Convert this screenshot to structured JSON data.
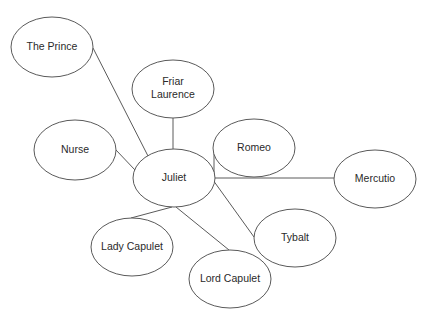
{
  "diagram": {
    "title": "",
    "type": "character-relationship-network",
    "center_node": "juliet",
    "nodes": [
      {
        "id": "prince",
        "label": "The Prince",
        "lines": [
          "The Prince"
        ],
        "cx": 52,
        "cy": 47,
        "rx": 41,
        "ry": 30
      },
      {
        "id": "friar",
        "label": "Friar Laurence",
        "lines": [
          "Friar",
          "Laurence"
        ],
        "cx": 173,
        "cy": 89,
        "rx": 41,
        "ry": 29
      },
      {
        "id": "nurse",
        "label": "Nurse",
        "lines": [
          "Nurse"
        ],
        "cx": 75,
        "cy": 150,
        "rx": 41,
        "ry": 30
      },
      {
        "id": "juliet",
        "label": "Juliet",
        "lines": [
          "Juliet"
        ],
        "cx": 174,
        "cy": 178,
        "rx": 41,
        "ry": 29
      },
      {
        "id": "romeo",
        "label": "Romeo",
        "lines": [
          "Romeo"
        ],
        "cx": 254,
        "cy": 148,
        "rx": 41,
        "ry": 29
      },
      {
        "id": "mercutio",
        "label": "Mercutio",
        "lines": [
          "Mercutio"
        ],
        "cx": 375,
        "cy": 179,
        "rx": 41,
        "ry": 29
      },
      {
        "id": "tybalt",
        "label": "Tybalt",
        "lines": [
          "Tybalt"
        ],
        "cx": 295,
        "cy": 238,
        "rx": 41,
        "ry": 29
      },
      {
        "id": "lady-capulet",
        "label": "Lady Capulet",
        "lines": [
          "Lady Capulet"
        ],
        "cx": 132,
        "cy": 247,
        "rx": 41,
        "ry": 29
      },
      {
        "id": "lord-capulet",
        "label": "Lord Capulet",
        "lines": [
          "Lord Capulet"
        ],
        "cx": 230,
        "cy": 279,
        "rx": 41,
        "ry": 29
      }
    ],
    "edges": [
      {
        "from": "juliet",
        "to": "prince",
        "points": [
          [
            93,
            48
          ],
          [
            148,
            156
          ]
        ]
      },
      {
        "from": "juliet",
        "to": "friar",
        "points": [
          [
            173,
            118
          ],
          [
            173,
            149
          ]
        ]
      },
      {
        "from": "juliet",
        "to": "nurse",
        "points": [
          [
            116,
            150
          ],
          [
            135,
            170
          ]
        ]
      },
      {
        "from": "juliet",
        "to": "romeo",
        "points": [
          [
            214,
            150
          ],
          [
            214,
            178
          ]
        ]
      },
      {
        "from": "juliet",
        "to": "mercutio",
        "points": [
          [
            215,
            178
          ],
          [
            334,
            178
          ]
        ]
      },
      {
        "from": "juliet",
        "to": "tybalt",
        "points": [
          [
            213,
            180
          ],
          [
            254,
            237
          ]
        ]
      },
      {
        "from": "juliet",
        "to": "lady-capulet",
        "points": [
          [
            172,
            207
          ],
          [
            131,
            218
          ]
        ]
      },
      {
        "from": "juliet",
        "to": "lord-capulet",
        "points": [
          [
            176,
            207
          ],
          [
            229,
            250
          ]
        ]
      }
    ],
    "colors": {
      "stroke": "#5a5a5a",
      "text": "#2a2a2a",
      "background": "#ffffff",
      "node_fill": "#ffffff"
    }
  }
}
